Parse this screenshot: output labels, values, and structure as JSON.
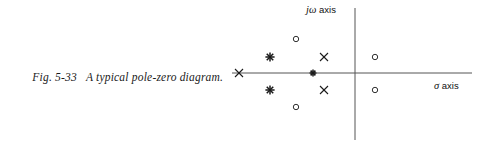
{
  "figure": {
    "caption_number": "Fig. 5-33",
    "caption_text": "A typical pole-zero diagram.",
    "ink_color": "#1a1a1a",
    "axis_color": "#555555",
    "background": "#ffffff"
  },
  "axes": {
    "vertical": {
      "label_symbol": "jω",
      "label_text": " axis",
      "x": 355,
      "y_top": 8,
      "y_bottom": 140
    },
    "horizontal": {
      "label_symbol": "σ",
      "label_text": " axis",
      "y": 73,
      "x_left": 232,
      "x_right": 472
    },
    "origin": {
      "x": 355,
      "y": 73
    }
  },
  "chart_data": {
    "type": "scatter",
    "title": "A typical pole-zero diagram.",
    "xlabel": "σ axis",
    "ylabel": "jω axis",
    "grid": false,
    "legend": null,
    "axis_origin_px": {
      "x": 355,
      "y": 73
    },
    "note": "Pole-zero plot in the complex s-plane. Markers given in pixel coordinates; poles are crosses, zeros are open circles, asterisks denote double (repeated) poles. All off-axis markers occur in complex-conjugate pairs.",
    "series": [
      {
        "name": "poles",
        "marker": "cross",
        "symbol": "×",
        "points": [
          {
            "x": 239,
            "y": 73,
            "label": "real-axis pole (far left)"
          },
          {
            "x": 324,
            "y": 57,
            "label": "complex pole (upper)"
          },
          {
            "x": 324,
            "y": 90,
            "label": "complex pole (lower)"
          }
        ]
      },
      {
        "name": "zeros",
        "marker": "circle",
        "symbol": "○",
        "points": [
          {
            "x": 296,
            "y": 39,
            "label": "complex zero (upper inner)"
          },
          {
            "x": 296,
            "y": 107,
            "label": "complex zero (lower inner)"
          },
          {
            "x": 375,
            "y": 57,
            "label": "complex zero (upper right)"
          },
          {
            "x": 375,
            "y": 90,
            "label": "complex zero (lower right)"
          }
        ]
      },
      {
        "name": "double-poles",
        "marker": "asterisk",
        "symbol": "✳",
        "points": [
          {
            "x": 270,
            "y": 57,
            "label": "double complex pole (upper)"
          },
          {
            "x": 270,
            "y": 90,
            "label": "double complex pole (lower)"
          },
          {
            "x": 313,
            "y": 73,
            "label": "double real-axis pole"
          }
        ]
      }
    ]
  }
}
